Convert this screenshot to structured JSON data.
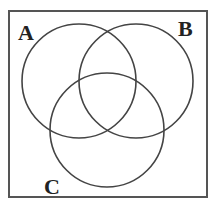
{
  "diagram": {
    "type": "venn",
    "universe_box": {
      "x": 9,
      "y": 11,
      "width": 198,
      "height": 186,
      "stroke": "#555555"
    },
    "circles": [
      {
        "name": "A",
        "cx": 79,
        "cy": 81,
        "r": 57
      },
      {
        "name": "B",
        "cx": 136,
        "cy": 81,
        "r": 57
      },
      {
        "name": "C",
        "cx": 107,
        "cy": 130,
        "r": 57
      }
    ],
    "labels": [
      {
        "text": "A",
        "x": 18,
        "y": 40
      },
      {
        "text": "B",
        "x": 178,
        "y": 36
      },
      {
        "text": "C",
        "x": 44,
        "y": 194
      }
    ],
    "colors": {
      "line": "#444444",
      "background": "#ffffff",
      "label": "#222222"
    }
  }
}
